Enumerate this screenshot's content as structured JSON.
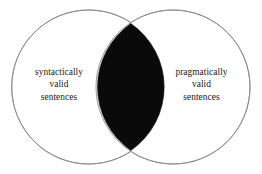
{
  "figure": {
    "type": "venn-diagram",
    "title": "",
    "background_color": "#ffffff",
    "stroke_color": "#8a8a8a",
    "intersection_fill": "#0a0a0a",
    "circle_fill": "#ffffff",
    "width": 262,
    "height": 174
  },
  "sets": {
    "left": {
      "name": "syntactically-valid-sentences",
      "lines": [
        "syntactically",
        "valid",
        "sentences"
      ],
      "center_x": 88.7,
      "center_y": 87,
      "radius": 77
    },
    "right": {
      "name": "pragmatically-valid-sentences",
      "lines": [
        "pragmatically",
        "valid",
        "sentences"
      ],
      "center_x": 173.0,
      "center_y": 87,
      "radius": 77
    },
    "intersection": {
      "name": "syntactically-and-pragmatically-valid",
      "label": "",
      "shaded": true,
      "top_point_x": 130.85,
      "top_point_y": 23.6,
      "bottom_point_x": 130.85,
      "bottom_point_y": 150.4
    }
  }
}
